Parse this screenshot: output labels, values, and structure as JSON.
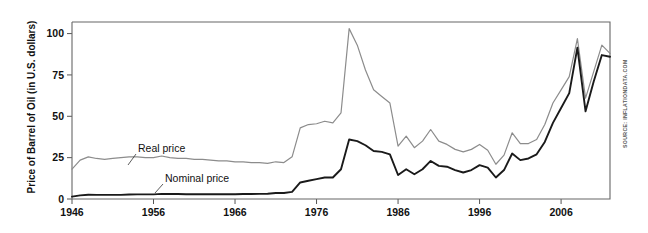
{
  "chart_data": {
    "type": "line",
    "title": "",
    "xlabel": "",
    "ylabel": "Price of Barrel of Oil (in U.S. dollars)",
    "xlim": [
      1946,
      2012
    ],
    "ylim": [
      0,
      107
    ],
    "xticks": [
      1946,
      1956,
      1966,
      1976,
      1986,
      1996,
      2006
    ],
    "yticks": [
      0,
      25,
      50,
      75,
      100
    ],
    "grid": false,
    "legend_position": "inline-annotations",
    "source_note": "SOURCE: INFLATIONDATA.COM",
    "annotations": [
      {
        "text": "Real price",
        "series": "Real price"
      },
      {
        "text": "Nominal price",
        "series": "Nominal price"
      }
    ],
    "x": [
      1946,
      1947,
      1948,
      1949,
      1950,
      1951,
      1952,
      1953,
      1954,
      1955,
      1956,
      1957,
      1958,
      1959,
      1960,
      1961,
      1962,
      1963,
      1964,
      1965,
      1966,
      1967,
      1968,
      1969,
      1970,
      1971,
      1972,
      1973,
      1974,
      1975,
      1976,
      1977,
      1978,
      1979,
      1980,
      1981,
      1982,
      1983,
      1984,
      1985,
      1986,
      1987,
      1988,
      1989,
      1990,
      1991,
      1992,
      1993,
      1994,
      1995,
      1996,
      1997,
      1998,
      1999,
      2000,
      2001,
      2002,
      2003,
      2004,
      2005,
      2006,
      2007,
      2008,
      2009,
      2010,
      2011,
      2012
    ],
    "series": [
      {
        "name": "Real price",
        "color": "#8c8c8c",
        "values": [
          18.0,
          23.5,
          25.5,
          24.5,
          24.0,
          24.5,
          25.0,
          25.5,
          25.5,
          25.0,
          25.0,
          26.0,
          25.0,
          24.5,
          24.5,
          24.0,
          24.0,
          23.5,
          23.0,
          23.0,
          22.5,
          22.5,
          22.0,
          22.0,
          21.5,
          22.5,
          22.0,
          25.5,
          43.0,
          45.0,
          45.5,
          47.0,
          46.0,
          52.0,
          103.0,
          93.0,
          78.0,
          66.0,
          62.0,
          58.0,
          32.0,
          38.0,
          31.0,
          35.0,
          42.0,
          35.0,
          33.0,
          30.0,
          28.5,
          30.0,
          33.0,
          29.5,
          21.0,
          26.5,
          40.0,
          33.5,
          33.5,
          36.0,
          45.0,
          58.0,
          66.0,
          74.0,
          97.0,
          61.0,
          77.0,
          93.0,
          88.0
        ]
      },
      {
        "name": "Nominal price",
        "color": "#1a1a1a",
        "values": [
          1.4,
          2.2,
          2.6,
          2.5,
          2.5,
          2.5,
          2.5,
          2.7,
          2.8,
          2.8,
          2.8,
          3.1,
          3.0,
          3.0,
          2.9,
          2.9,
          2.9,
          2.9,
          2.9,
          2.9,
          2.9,
          3.0,
          3.0,
          3.1,
          3.2,
          3.6,
          3.6,
          4.3,
          10.0,
          11.0,
          12.0,
          13.0,
          13.0,
          18.0,
          36.0,
          35.0,
          32.5,
          29.0,
          28.5,
          27.0,
          14.5,
          18.0,
          15.0,
          18.0,
          23.0,
          20.0,
          19.5,
          17.5,
          16.0,
          17.5,
          20.5,
          19.0,
          13.0,
          17.5,
          27.5,
          23.5,
          24.5,
          27.0,
          34.5,
          46.0,
          55.0,
          64.0,
          91.5,
          53.0,
          71.0,
          87.0,
          86.0
        ]
      }
    ]
  }
}
